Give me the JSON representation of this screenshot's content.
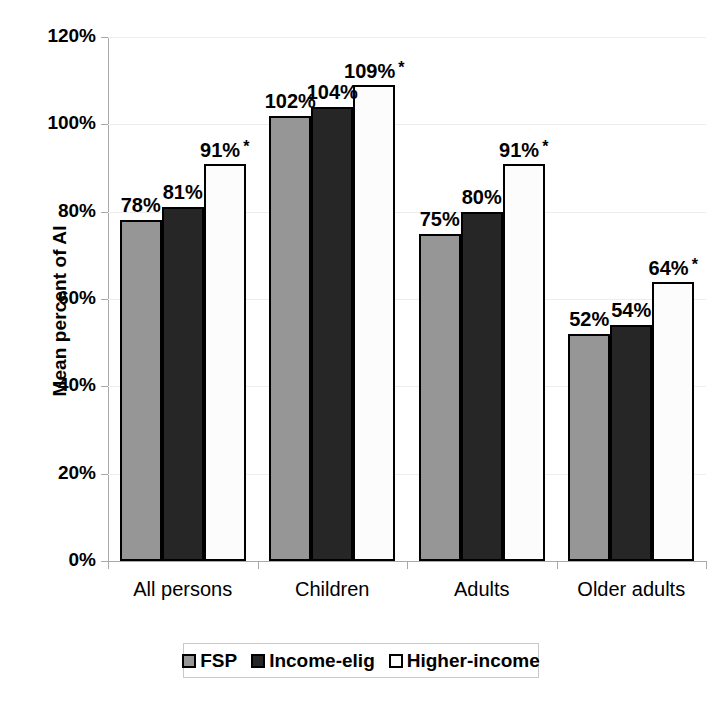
{
  "chart_data": {
    "type": "bar",
    "title": "",
    "xlabel": "",
    "ylabel": "Mean percent of AI",
    "ylim": [
      0,
      120
    ],
    "yticks": [
      "0%",
      "20%",
      "40%",
      "60%",
      "80%",
      "100%",
      "120%"
    ],
    "ytick_values": [
      0,
      20,
      40,
      60,
      80,
      100,
      120
    ],
    "grid": true,
    "legend_position": "bottom",
    "categories": [
      "All persons",
      "Children",
      "Adults",
      "Older adults"
    ],
    "series": [
      {
        "name": "FSP",
        "color": "#969696",
        "values": [
          78,
          102,
          75,
          52
        ],
        "labels": [
          "78%",
          "102%",
          "75%",
          "52%"
        ],
        "significance": [
          "",
          "",
          "",
          ""
        ]
      },
      {
        "name": "Income-elig",
        "color": "#262626",
        "values": [
          81,
          104,
          80,
          54
        ],
        "labels": [
          "81%",
          "104%",
          "80%",
          "54%"
        ],
        "significance": [
          "",
          "",
          "",
          ""
        ]
      },
      {
        "name": "Higher-income",
        "color": "#fcfcfc",
        "values": [
          91,
          109,
          91,
          64
        ],
        "labels": [
          "91%",
          "109%",
          "91%",
          "64%"
        ],
        "significance": [
          "*",
          "*",
          "*",
          "*"
        ]
      }
    ]
  },
  "legend": {
    "items": [
      {
        "label": "FSP",
        "color": "#969696"
      },
      {
        "label": "Income-elig",
        "color": "#262626"
      },
      {
        "label": "Higher-income",
        "color": "#fcfcfc"
      }
    ]
  },
  "axis": {
    "y_title": "Mean percent of AI"
  }
}
